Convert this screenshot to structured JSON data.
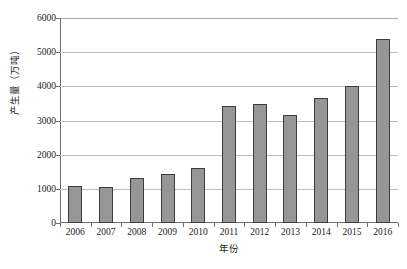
{
  "chart_data": {
    "type": "bar",
    "title": "",
    "xlabel": "年份",
    "ylabel": "产生量（万吨）",
    "categories": [
      "2006",
      "2007",
      "2008",
      "2009",
      "2010",
      "2011",
      "2012",
      "2013",
      "2014",
      "2015",
      "2016"
    ],
    "values": [
      1080,
      1050,
      1330,
      1420,
      1600,
      3430,
      3480,
      3170,
      3650,
      4000,
      5380
    ],
    "series": [
      {
        "name": "产生量",
        "values": [
          1080,
          1050,
          1330,
          1420,
          1600,
          3430,
          3480,
          3170,
          3650,
          4000,
          5380
        ]
      }
    ],
    "ylim": [
      0,
      6000
    ],
    "ytick_labels": [
      "0",
      "1000",
      "2000",
      "3000",
      "4000",
      "5000",
      "6000"
    ],
    "ytick_values": [
      0,
      1000,
      2000,
      3000,
      4000,
      5000,
      6000
    ],
    "ytick_step": 1000,
    "grid": true,
    "legend": false,
    "legend_position": "none",
    "bar_color": "#969696",
    "bar_border_color": "#3d3d3d",
    "gridline_color": "#bfbfbf",
    "axis_color": "#6e6e6e",
    "background_color": "#ffffff"
  }
}
